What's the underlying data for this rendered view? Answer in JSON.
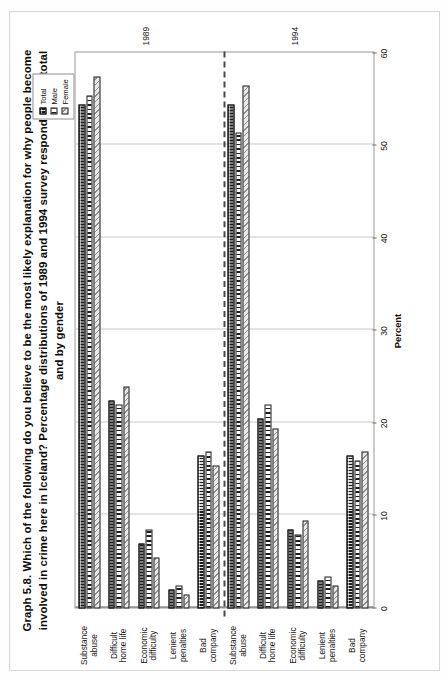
{
  "figure": {
    "period_labels": {
      "first": "1989",
      "second": "1994"
    }
  },
  "legend": {
    "items": [
      {
        "label": "Total",
        "pattern": "solid-dark-crosshatch",
        "color": "#1c1c1c"
      },
      {
        "label": "Male",
        "pattern": "vertical-stripes",
        "color": "#ffffff"
      },
      {
        "label": "Female",
        "pattern": "diagonal-hatch",
        "color": "#e9e9e9"
      }
    ]
  },
  "chart_data": {
    "type": "bar",
    "orientation": "horizontal",
    "xlabel": "",
    "ylabel": "Percent",
    "ylim": [
      0,
      60
    ],
    "yticks": [
      0,
      10,
      20,
      30,
      40,
      50,
      60
    ],
    "ytick_labels": [
      "0",
      "10",
      "20",
      "30",
      "40",
      "50",
      "60"
    ],
    "grid": true,
    "legend_position": "top-right",
    "group_annotations": [
      "1989",
      "1994"
    ],
    "categories": [
      "Substance abuse",
      "Difficult home life",
      "Economic difficulty",
      "Lenient penalties",
      "Bad company",
      "Substance abuse",
      "Difficult home life",
      "Economic difficulty",
      "Lenient penalties",
      "Bad company"
    ],
    "category_periods": [
      "1989",
      "1989",
      "1989",
      "1989",
      "1989",
      "1994",
      "1994",
      "1994",
      "1994",
      "1994"
    ],
    "series": [
      {
        "name": "Total",
        "values": [
          54.5,
          22.5,
          7.0,
          2.0,
          16.5,
          54.5,
          20.5,
          8.5,
          3.0,
          16.5
        ]
      },
      {
        "name": "Male",
        "values": [
          55.5,
          22.0,
          8.5,
          2.5,
          17.0,
          51.5,
          22.0,
          8.0,
          3.5,
          16.0
        ]
      },
      {
        "name": "Female",
        "values": [
          57.5,
          24.0,
          5.5,
          1.5,
          15.5,
          56.5,
          19.5,
          9.5,
          2.5,
          17.0
        ]
      }
    ]
  },
  "rows": [
    {
      "cat_line1": "Substance",
      "cat_line2": "abuse",
      "period": "1989",
      "total": 54.5,
      "male": 55.5,
      "female": 57.5
    },
    {
      "cat_line1": "Difficult",
      "cat_line2": "home life",
      "period": "1989",
      "total": 22.5,
      "male": 22.0,
      "female": 24.0
    },
    {
      "cat_line1": "Economic",
      "cat_line2": "difficulty",
      "period": "1989",
      "total": 7.0,
      "male": 8.5,
      "female": 5.5
    },
    {
      "cat_line1": "Lenient",
      "cat_line2": "penalties",
      "period": "1989",
      "total": 2.0,
      "male": 2.5,
      "female": 1.5
    },
    {
      "cat_line1": "Bad",
      "cat_line2": "company",
      "period": "1989",
      "total": 16.5,
      "male": 17.0,
      "female": 15.5
    },
    {
      "cat_line1": "Substance",
      "cat_line2": "abuse",
      "period": "1994",
      "total": 54.5,
      "male": 51.5,
      "female": 56.5
    },
    {
      "cat_line1": "Difficult",
      "cat_line2": "home life",
      "period": "1994",
      "total": 20.5,
      "male": 22.0,
      "female": 19.5
    },
    {
      "cat_line1": "Economic",
      "cat_line2": "difficulty",
      "period": "1994",
      "total": 8.5,
      "male": 8.0,
      "female": 9.5
    },
    {
      "cat_line1": "Lenient",
      "cat_line2": "penalties",
      "period": "1994",
      "total": 3.0,
      "male": 3.5,
      "female": 2.5
    },
    {
      "cat_line1": "Bad",
      "cat_line2": "company",
      "period": "1994",
      "total": 16.5,
      "male": 16.0,
      "female": 17.0
    }
  ]
}
